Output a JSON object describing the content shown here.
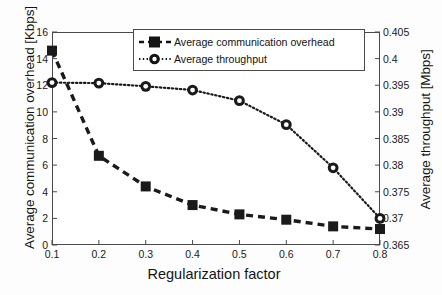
{
  "chart_data": {
    "type": "line",
    "title": "",
    "xlabel": "Regularization factor",
    "ylabel": "Average communication overhead [Kbps]",
    "ylabel_right": "Average throughput [Mbps]",
    "x": [
      0.1,
      0.2,
      0.3,
      0.4,
      0.5,
      0.6,
      0.7,
      0.8
    ],
    "xlim": [
      0.1,
      0.8
    ],
    "ylim": [
      0,
      16
    ],
    "ylim_right": [
      0.365,
      0.405
    ],
    "xticks": [
      "0.1",
      "0.2",
      "0.3",
      "0.4",
      "0.5",
      "0.6",
      "0.7",
      "0.8"
    ],
    "yticks": [
      "0",
      "2",
      "4",
      "6",
      "8",
      "10",
      "12",
      "14",
      "16"
    ],
    "yticks_right": [
      "0.365",
      "0.37",
      "0.375",
      "0.38",
      "0.385",
      "0.39",
      "0.395",
      "0.4",
      "0.405"
    ],
    "grid": false,
    "legend_position": "top-center",
    "series": [
      {
        "name": "Average communication overhead",
        "axis": "left",
        "marker": "square",
        "linestyle": "dashed",
        "color": "#1a1a1a",
        "values": [
          14.6,
          6.7,
          4.4,
          3.0,
          2.3,
          1.9,
          1.4,
          1.2
        ]
      },
      {
        "name": "Average throughput",
        "axis": "right",
        "marker": "circle",
        "linestyle": "dotted",
        "color": "#1a1a1a",
        "values": [
          0.3955,
          0.3954,
          0.3948,
          0.3941,
          0.3921,
          0.3876,
          0.3795,
          0.37
        ]
      }
    ]
  },
  "legend": {
    "items": [
      {
        "label": "Average communication overhead",
        "marker": "square-dashed-sample"
      },
      {
        "label": "Average throughput",
        "marker": "circle-dotted-sample"
      }
    ]
  }
}
